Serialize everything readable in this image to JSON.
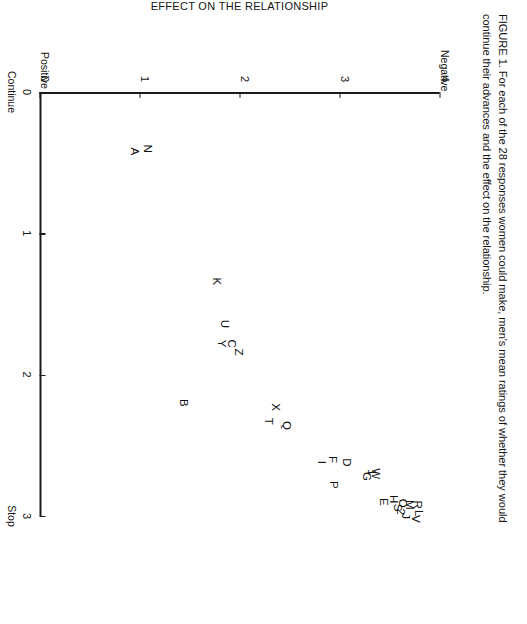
{
  "caption": {
    "lines": [
      "FIGURE 1. For each of the 28 responses women could make, men's mean ratings of whether they would",
      "continue their advances and the effect on the relationship."
    ]
  },
  "chart_data": {
    "type": "scatter",
    "title": "",
    "xlabel": "WHAT MEN WOULD DO",
    "ylabel": "EFFECT ON THE RELATIONSHIP",
    "xlim": [
      0,
      3
    ],
    "ylim": [
      0,
      4
    ],
    "xticks": [
      "0",
      "1",
      "2",
      "3"
    ],
    "yticks": [
      "0",
      "1",
      "2",
      "3",
      "4"
    ],
    "x_end_labels": {
      "low": "Continue",
      "high": "Stop"
    },
    "y_end_labels": {
      "low": "Positive",
      "high": "Negative"
    },
    "grid": false,
    "legend": false,
    "point_count": 28,
    "points": [
      {
        "label": "A",
        "x": 0.42,
        "y": 0.95
      },
      {
        "label": "N",
        "x": 0.4,
        "y": 1.08
      },
      {
        "label": "K",
        "x": 1.34,
        "y": 1.77
      },
      {
        "label": "U",
        "x": 1.64,
        "y": 1.85
      },
      {
        "label": "C",
        "x": 1.78,
        "y": 1.92
      },
      {
        "label": "Y",
        "x": 1.78,
        "y": 1.82
      },
      {
        "label": "Z",
        "x": 1.84,
        "y": 1.99
      },
      {
        "label": "B",
        "x": 2.2,
        "y": 1.44
      },
      {
        "label": "X",
        "x": 2.23,
        "y": 2.36
      },
      {
        "label": "T",
        "x": 2.33,
        "y": 2.29
      },
      {
        "label": "Q",
        "x": 2.36,
        "y": 2.47
      },
      {
        "label": "I",
        "x": 2.62,
        "y": 2.82
      },
      {
        "label": "F",
        "x": 2.6,
        "y": 2.93
      },
      {
        "label": "D",
        "x": 2.62,
        "y": 3.07
      },
      {
        "label": "G",
        "x": 2.72,
        "y": 3.27
      },
      {
        "label": "W",
        "x": 2.7,
        "y": 3.36
      },
      {
        "label": "P",
        "x": 2.78,
        "y": 2.94
      },
      {
        "label": "E",
        "x": 2.9,
        "y": 3.44
      },
      {
        "label": "H",
        "x": 2.88,
        "y": 3.54
      },
      {
        "label": "O",
        "x": 2.91,
        "y": 3.63
      },
      {
        "label": "M",
        "x": 2.92,
        "y": 3.7
      },
      {
        "label": "S",
        "x": 2.94,
        "y": 3.58
      },
      {
        "label": "R",
        "x": 2.92,
        "y": 3.78
      },
      {
        "label": "2",
        "x": 2.97,
        "y": 3.61
      },
      {
        "label": "J",
        "x": 3.0,
        "y": 3.66
      },
      {
        "label": "L",
        "x": 2.98,
        "y": 3.79
      },
      {
        "label": "V",
        "x": 3.02,
        "y": 3.76
      },
      {
        "label": "1",
        "x": 2.69,
        "y": 3.32
      }
    ]
  }
}
